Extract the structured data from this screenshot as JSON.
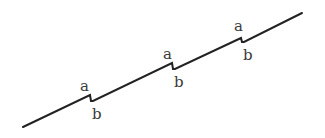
{
  "diagram": {
    "line_color": "#222222",
    "label_color": "#3a3a3a",
    "steps": [
      {
        "top_label": "a",
        "bottom_label": "b"
      },
      {
        "top_label": "a",
        "bottom_label": "b"
      },
      {
        "top_label": "a",
        "bottom_label": "b"
      }
    ]
  }
}
